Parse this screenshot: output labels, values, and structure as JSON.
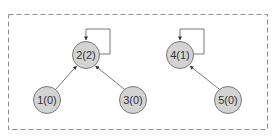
{
  "diagram": {
    "type": "directed-graph",
    "container": {
      "style": "dashed",
      "border_color": "#8c8c8c"
    },
    "colors": {
      "node_fill": "#d3d3d3",
      "node_stroke": "#7a7a7a",
      "edge": "#555555",
      "text": "#333333"
    },
    "nodes": [
      {
        "id": "1",
        "label": "1(0)",
        "cx": 47,
        "cy": 100
      },
      {
        "id": "2",
        "label": "2(2)",
        "cx": 86,
        "cy": 55
      },
      {
        "id": "3",
        "label": "3(0)",
        "cx": 133,
        "cy": 100
      },
      {
        "id": "4",
        "label": "4(1)",
        "cx": 180,
        "cy": 55
      },
      {
        "id": "5",
        "label": "5(0)",
        "cx": 228,
        "cy": 100
      }
    ],
    "edges": [
      {
        "from": "1",
        "to": "2"
      },
      {
        "from": "3",
        "to": "2"
      },
      {
        "from": "5",
        "to": "4"
      },
      {
        "from": "2",
        "to": "2",
        "self_loop": true
      },
      {
        "from": "4",
        "to": "4",
        "self_loop": true
      }
    ]
  }
}
